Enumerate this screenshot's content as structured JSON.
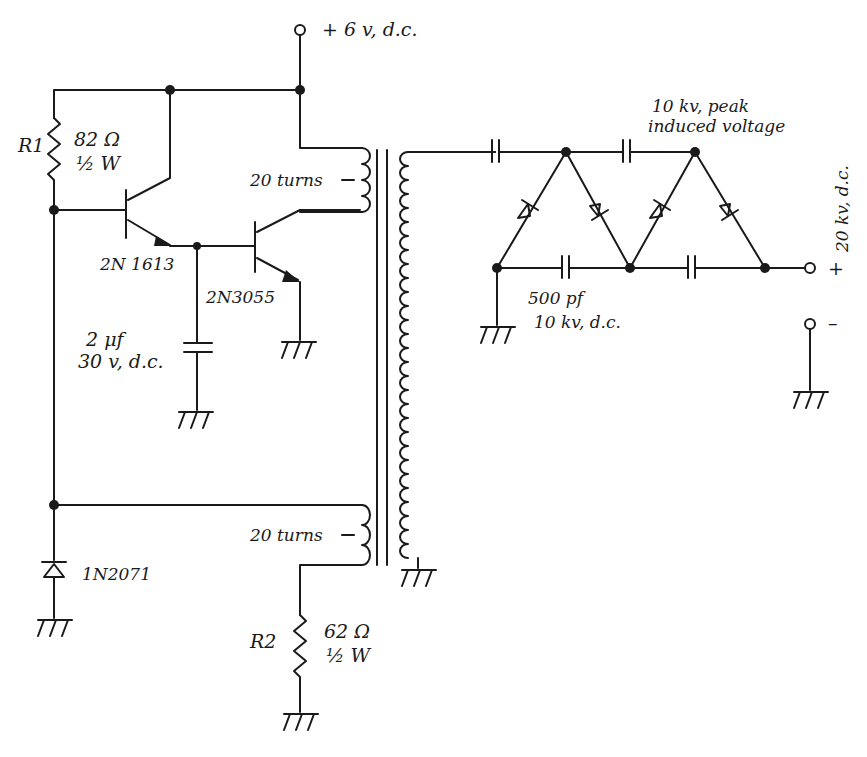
{
  "diagram": {
    "type": "circuit-schematic",
    "supply": {
      "label": "+ 6 v, d.c."
    },
    "r1": {
      "name": "R1",
      "value": "82 Ω",
      "power": "½ W"
    },
    "r2": {
      "name": "R2",
      "value": "62 Ω",
      "power": "½ W"
    },
    "q1": {
      "label": "2N 1613"
    },
    "q2": {
      "label": "2N3055"
    },
    "c1": {
      "value": "2 μf",
      "rating": "30 v, d.c."
    },
    "diode": {
      "label": "1N2071"
    },
    "winding_top": {
      "label": "20 turns"
    },
    "winding_bottom": {
      "label": "20 turns"
    },
    "multiplier": {
      "peak_label_1": "10 kv, peak",
      "peak_label_2": "induced voltage",
      "cap_value": "500 pf",
      "cap_rating": "10 kv, d.c."
    },
    "output": {
      "positive": "+ 20 kv, d.c.",
      "plus_sign": "+",
      "minus_sign": "–"
    }
  }
}
